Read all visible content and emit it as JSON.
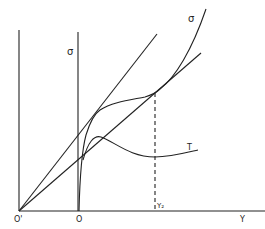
{
  "diagram": {
    "labels": {
      "origin_prime": "O'",
      "origin": "O",
      "sigma_axis": "σ",
      "sigma_curve": "σ",
      "tau_curve": "T",
      "y2": "Y₂",
      "x_axis": "Y"
    },
    "colors": {
      "ink": "#222222",
      "background": "#ffffff"
    }
  }
}
